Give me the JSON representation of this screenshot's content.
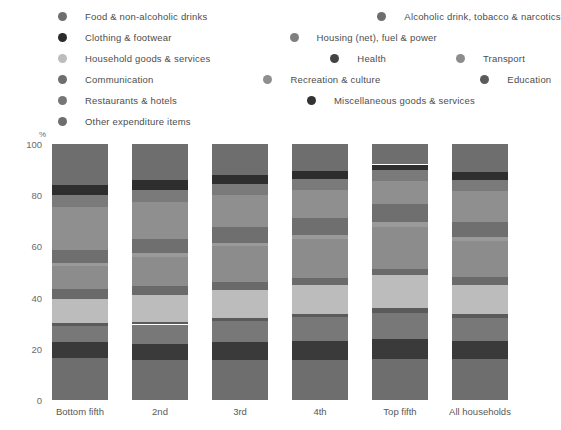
{
  "axis": {
    "y_unit": "%",
    "y_ticks": [
      "100",
      "80",
      "60",
      "40",
      "20",
      "0"
    ],
    "y_tick_values": [
      100,
      80,
      60,
      40,
      20,
      0
    ]
  },
  "legend": {
    "rows": [
      [
        {
          "label": "Food & non-alcoholic drinks",
          "color": "#6e6e6e"
        },
        {
          "label": "Alcoholic drink, tobacco & narcotics",
          "color": "#6e6e6e"
        }
      ],
      [
        {
          "label": "Clothing & footwear",
          "color": "#2b2b2b"
        },
        {
          "label": "Housing (net), fuel & power",
          "color": "#7f7f7f"
        }
      ],
      [
        {
          "label": "Household goods & services",
          "color": "#bdbdbd"
        },
        {
          "label": "Health",
          "color": "#434343"
        },
        {
          "label": "Transport",
          "color": "#8c8c8c"
        }
      ],
      [
        {
          "label": "Communication",
          "color": "#6e6e6e"
        },
        {
          "label": "Recreation & culture",
          "color": "#8f8f8f"
        },
        {
          "label": "Education",
          "color": "#5b5b5b"
        }
      ],
      [
        {
          "label": "Restaurants & hotels",
          "color": "#767676"
        },
        {
          "label": "Miscellaneous goods & services",
          "color": "#333333"
        }
      ],
      [
        {
          "label": "Other expenditure items",
          "color": "#6e6e6e"
        }
      ]
    ]
  },
  "chart_data": {
    "type": "bar",
    "stacked": true,
    "title": "",
    "xlabel": "",
    "ylabel": "%",
    "ylim": [
      0,
      100
    ],
    "grid": false,
    "legend_position": "top",
    "categories": [
      "Bottom fifth",
      "2nd",
      "3rd",
      "4th",
      "Top fifth",
      "All households"
    ],
    "series": [
      {
        "name": "Food & non-alcoholic drinks",
        "color": "#6e6e6e",
        "values": [
          16.0,
          14.0,
          12.0,
          10.5,
          8.0,
          11.0
        ]
      },
      {
        "name": "Alcoholic drink, tobacco & narcotics",
        "color": "#2e2e2e",
        "values": [
          4.0,
          4.0,
          3.5,
          3.0,
          2.0,
          3.0
        ]
      },
      {
        "name": "Clothing & footwear",
        "color": "#7a7a7a",
        "values": [
          4.5,
          4.5,
          4.5,
          4.5,
          4.5,
          4.5
        ]
      },
      {
        "name": "Housing (net), fuel & power",
        "color": "#8f8f8f",
        "values": [
          17.0,
          14.5,
          12.5,
          11.0,
          9.0,
          12.0
        ]
      },
      {
        "name": "Household goods & services",
        "color": "#6f6f6f",
        "values": [
          5.0,
          5.5,
          6.0,
          6.5,
          7.0,
          6.0
        ]
      },
      {
        "name": "Health",
        "color": "#9a9a9a",
        "values": [
          1.0,
          1.5,
          1.5,
          1.5,
          2.0,
          1.5
        ]
      },
      {
        "name": "Transport",
        "color": "#8c8c8c",
        "values": [
          9.0,
          11.5,
          14.0,
          15.5,
          16.5,
          14.0
        ]
      },
      {
        "name": "Communication",
        "color": "#6a6a6a",
        "values": [
          4.0,
          3.5,
          3.0,
          2.5,
          2.0,
          3.0
        ]
      },
      {
        "name": "Recreation & culture",
        "color": "#bcbcbc",
        "values": [
          9.5,
          10.5,
          11.0,
          11.5,
          13.0,
          11.5
        ]
      },
      {
        "name": "Education",
        "color": "#5b5b5b",
        "values": [
          1.0,
          1.0,
          1.0,
          1.0,
          2.0,
          1.5
        ]
      },
      {
        "name": "Restaurants & hotels",
        "color": "#787878",
        "values": [
          6.5,
          7.5,
          8.5,
          9.5,
          10.0,
          9.0
        ]
      },
      {
        "name": "Miscellaneous goods & services",
        "color": "#3a3a3a",
        "values": [
          6.0,
          6.5,
          7.0,
          7.5,
          8.0,
          7.0
        ]
      },
      {
        "name": "Other expenditure items",
        "color": "#6e6e6e",
        "values": [
          16.5,
          15.5,
          15.5,
          15.5,
          16.0,
          16.0
        ]
      }
    ]
  }
}
